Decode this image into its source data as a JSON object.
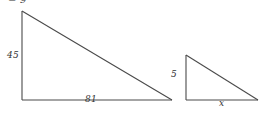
{
  "figure": {
    "title_fragment": "= 9",
    "background_color": "#ffffff",
    "stroke_color": "#4a4a4a",
    "text_color": "#333333",
    "shapes": [
      {
        "name": "large-right-triangle",
        "apex": [
          22,
          11
        ],
        "bottom_left": [
          22,
          100
        ],
        "bottom_right": [
          172,
          100
        ],
        "vertical_leg_label": "45",
        "horizontal_leg_label": "81"
      },
      {
        "name": "small-right-triangle",
        "apex": [
          186,
          55
        ],
        "bottom_left": [
          186,
          100
        ],
        "bottom_right": [
          258,
          100
        ],
        "vertical_leg_label": "5",
        "horizontal_leg_label": "x"
      }
    ],
    "labels": {
      "equation": "= 9",
      "large_vertical": "45",
      "large_base": "81",
      "small_vertical": "5",
      "small_base": "x"
    }
  }
}
